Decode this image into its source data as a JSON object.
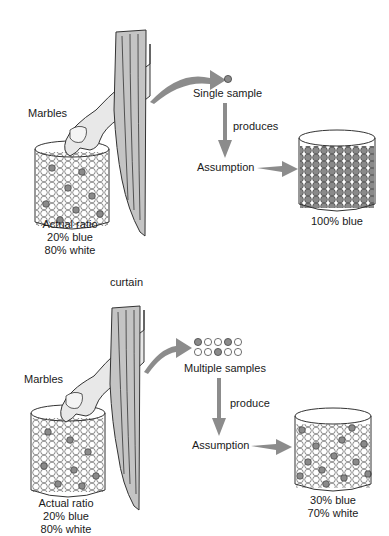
{
  "top_panel": {
    "marbles_label": "Marbles",
    "jar_caption": [
      "Actual ratio",
      "20% blue",
      "80% white"
    ],
    "sample_label": "Single sample",
    "verb": "produces",
    "assumption_label": "Assumption",
    "result_caption": [
      "100% blue"
    ]
  },
  "divider_label": "curtain",
  "bottom_panel": {
    "marbles_label": "Marbles",
    "jar_caption": [
      "Actual ratio",
      "20% blue",
      "80% white"
    ],
    "sample_label": "Multiple samples",
    "sample_grid": [
      [
        "blue",
        "white",
        "white",
        "blue",
        "white"
      ],
      [
        "white",
        "white",
        "blue",
        "white",
        "white"
      ]
    ],
    "verb": "produce",
    "assumption_label": "Assumption",
    "result_caption": [
      "30% blue",
      "70% white"
    ]
  },
  "colors": {
    "blue_marble": "#8a8a8a",
    "white_marble": "#ffffff",
    "arrow": "#8c8c8c",
    "curtain": "#c4c4c4",
    "outline": "#333333"
  }
}
